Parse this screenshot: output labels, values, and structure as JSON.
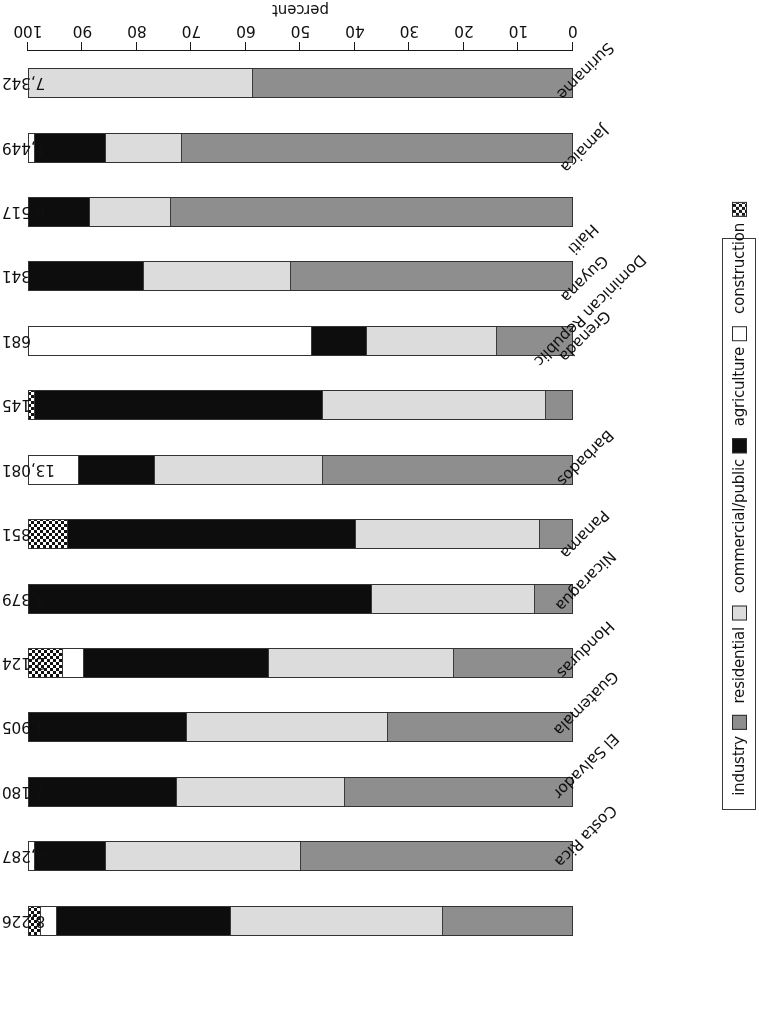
{
  "chart_data": {
    "type": "bar",
    "orientation": "horizontal-stacked",
    "title": "",
    "xlabel": "percent",
    "ylabel": "",
    "xlim": [
      0,
      100
    ],
    "xticks": [
      "0",
      "10",
      "20",
      "30",
      "40",
      "50",
      "60",
      "70",
      "80",
      "90",
      "100"
    ],
    "axis_reversed": true,
    "grid": false,
    "legend_position": "right",
    "categories": [
      "Costa Rica",
      "El Salvador",
      "Guatemala",
      "Honduras",
      "Nicaragua",
      "Panama",
      "Barbados",
      "Dominican Republic",
      "Grenada",
      "Guyana",
      "Haiti",
      "Jamaica",
      "Suriname",
      "Trinidad and Tobago"
    ],
    "value_labels": [
      "8,226",
      "4,287",
      "7,180",
      "4,905",
      "2,124",
      "5,379",
      "851",
      "13,081",
      "145",
      "681",
      "341",
      "6,517",
      "1,449",
      "7,342"
    ],
    "series": [
      {
        "name": "industry",
        "key": "industry",
        "color": "#8e8e8e",
        "pattern": "solid",
        "values": [
          24,
          50,
          42,
          34,
          22,
          7,
          6,
          46,
          5,
          14,
          52,
          74,
          72,
          59
        ]
      },
      {
        "name": "residential",
        "key": "residential",
        "color": "#dcdcdc",
        "pattern": "solid",
        "values": [
          39,
          36,
          31,
          37,
          34,
          30,
          34,
          31,
          41,
          24,
          27,
          15,
          14,
          41
        ]
      },
      {
        "name": "commercial/public",
        "key": "commercial",
        "color": "#0d0d0d",
        "pattern": "solid",
        "values": [
          32,
          13,
          27,
          29,
          34,
          63,
          53,
          14,
          53,
          10,
          21,
          11,
          13,
          0
        ]
      },
      {
        "name": "agriculture",
        "key": "agriculture",
        "color": "#ffffff",
        "pattern": "solid",
        "values": [
          3,
          1,
          0,
          0,
          4,
          0,
          0,
          9,
          0,
          52,
          0,
          0,
          1,
          0
        ]
      },
      {
        "name": "construction",
        "key": "construction",
        "color": "#ffffff",
        "pattern": "checker",
        "values": [
          2,
          0,
          0,
          0,
          6,
          0,
          7,
          0,
          1,
          0,
          0,
          0,
          0,
          0
        ]
      }
    ]
  },
  "legend": {
    "items": [
      {
        "label": "industry",
        "key": "industry"
      },
      {
        "label": "residential",
        "key": "residential"
      },
      {
        "label": "commercial/public",
        "key": "commercial"
      },
      {
        "label": "agriculture",
        "key": "agriculture"
      },
      {
        "label": "construction",
        "key": "construction"
      }
    ]
  }
}
